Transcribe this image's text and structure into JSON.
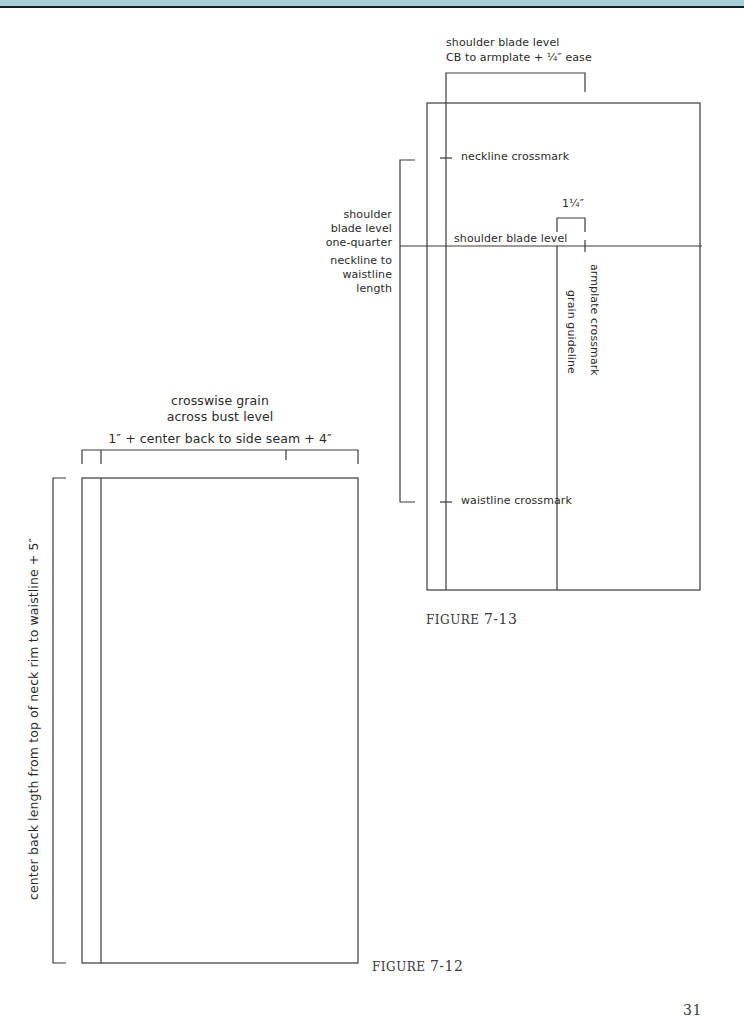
{
  "header": {
    "band_color": "#a9cfdc",
    "rule_color": "#1b1b1b"
  },
  "figure_7_13": {
    "caption_prefix": "FIGURE",
    "caption_number": "7-13",
    "top_label_line1": "shoulder blade level",
    "top_label_line2": "CB to armplate + ¼″ ease",
    "left_label": [
      "shoulder",
      "blade level",
      "one-quarter",
      "neckline to",
      "waistline",
      "length"
    ],
    "neckline_label": "neckline crossmark",
    "shoulder_blade_label": "shoulder blade level",
    "ease_label": "1¼″",
    "armplate_label": "armplate crossmark",
    "grain_label": "grain guideline",
    "waistline_label": "waistline crossmark"
  },
  "figure_7_12": {
    "caption_prefix": "FIGURE",
    "caption_number": "7-12",
    "top_label_line1": "crosswise grain",
    "top_label_line2": "across bust level",
    "measure_label": "1″ + center back to side seam + 4″",
    "left_label": "center back length from top of neck rim to waistline + 5″"
  },
  "page_number": "31"
}
